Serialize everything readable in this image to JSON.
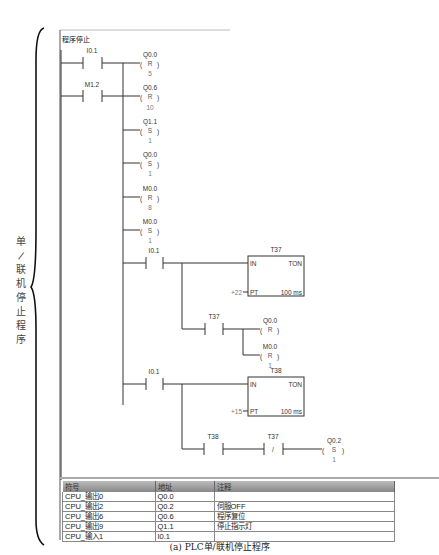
{
  "network": {
    "title": "程序停止",
    "side_label": [
      "单",
      "/",
      "联",
      "机",
      "停",
      "止",
      "程",
      "序"
    ]
  },
  "contacts": {
    "c1": {
      "address": "I0.1",
      "type": "NO"
    },
    "c2": {
      "address": "M1.2",
      "type": "NO"
    },
    "c3": {
      "address": "I0.1",
      "type": "NO"
    },
    "c4": {
      "address": "T37",
      "type": "NO"
    },
    "c5": {
      "address": "I0.1",
      "type": "NO"
    },
    "c6": {
      "address": "T38",
      "type": "NO"
    },
    "c7": {
      "address": "T37",
      "type": "NC",
      "glyph": "/"
    }
  },
  "coils": {
    "k1": {
      "address": "Q0.0",
      "op": "R",
      "n": "5"
    },
    "k2": {
      "address": "Q0.6",
      "op": "R",
      "n": "10"
    },
    "k3": {
      "address": "Q1.1",
      "op": "S",
      "n": "1"
    },
    "k4": {
      "address": "Q0.0",
      "op": "S",
      "n": "1"
    },
    "k5": {
      "address": "M0.0",
      "op": "R",
      "n": "8"
    },
    "k6": {
      "address": "M0.0",
      "op": "S",
      "n": "1"
    },
    "k7": {
      "address": "Q0.0",
      "op": "R",
      "n": ""
    },
    "k8": {
      "address": "M0.0",
      "op": "R",
      "n": "1"
    },
    "k9": {
      "address": "Q0.2",
      "op": "S",
      "n": "1"
    }
  },
  "timers": {
    "t1": {
      "name": "T37",
      "in": "IN",
      "type": "TON",
      "pt_label": "PT",
      "pt_value": "+22",
      "base": "100 ms"
    },
    "t2": {
      "name": "T38",
      "in": "IN",
      "type": "TON",
      "pt_label": "PT",
      "pt_value": "+15",
      "base": "100 ms"
    }
  },
  "symbol_table": {
    "headers": [
      "符号",
      "地址",
      "注释"
    ],
    "rows": [
      [
        "CPU_输出0",
        "Q0.0",
        ""
      ],
      [
        "CPU_输出2",
        "Q0.2",
        "伺服OFF"
      ],
      [
        "CPU_输出6",
        "Q0.6",
        "程序复位"
      ],
      [
        "CPU_输出9",
        "Q1.1",
        "停止指示灯"
      ],
      [
        "CPU_输入1",
        "I0.1",
        ""
      ]
    ]
  },
  "caption": "(a) PLC单/联机停止程序"
}
